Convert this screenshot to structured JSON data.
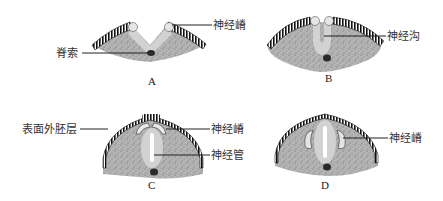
{
  "panels": [
    {
      "id": "A",
      "letter": "A",
      "labels": {
        "left": "脊索",
        "right": "神经嵴"
      }
    },
    {
      "id": "B",
      "letter": "B",
      "labels": {
        "right": "神经沟"
      }
    },
    {
      "id": "C",
      "letter": "C",
      "labels": {
        "left": "表面外胚层",
        "right_top": "神经嵴",
        "right_bottom": "神经管"
      }
    },
    {
      "id": "D",
      "letter": "D",
      "labels": {
        "right": "神经嵴"
      }
    }
  ],
  "colors": {
    "mesoderm": "#b8b8b8",
    "neural_plate": "#d6d6d6",
    "ectoderm_border": "#1e1e1e",
    "notochord": "#2a2a2a",
    "lumen": "#ffffff",
    "crest": "#e8e8e8"
  }
}
